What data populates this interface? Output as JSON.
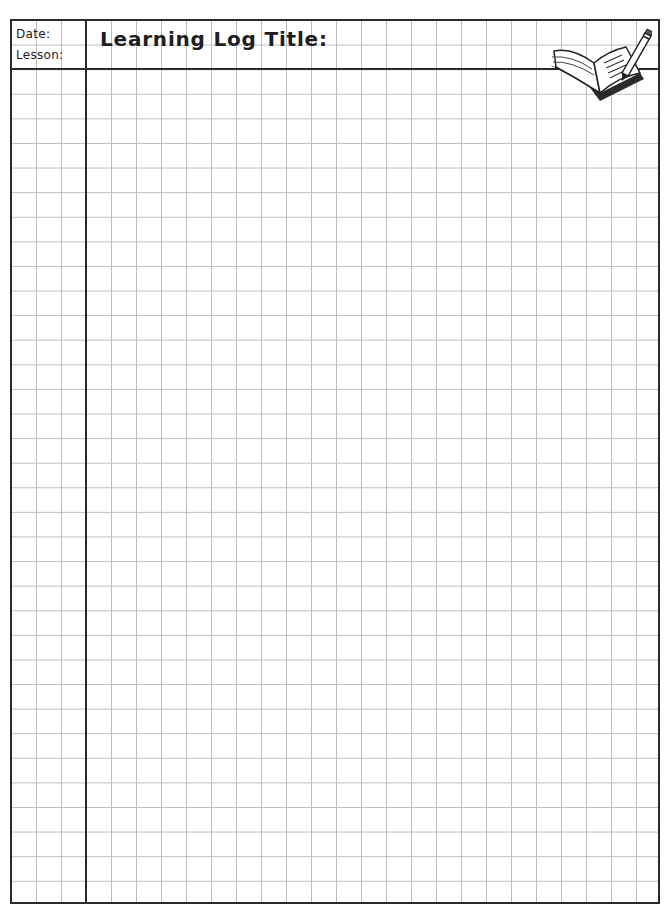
{
  "header": {
    "date_label": "Date:",
    "lesson_label": "Lesson:",
    "title_label": "Learning Log Title:"
  },
  "icon": {
    "name": "book-and-pencil-icon"
  },
  "grid": {
    "columns": 26,
    "rows": 36,
    "line_color": "#bdbdbd",
    "border_color": "#2b2b2b"
  }
}
